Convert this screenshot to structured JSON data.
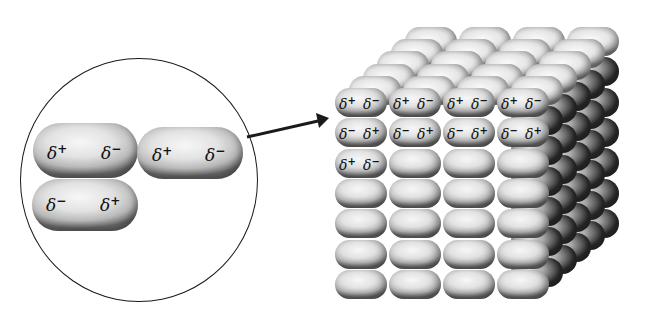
{
  "zoom_inset": {
    "molecules": [
      {
        "left": "δ",
        "left_sign": "+",
        "right": "δ",
        "right_sign": "−"
      },
      {
        "left": "δ",
        "left_sign": "+",
        "right": "δ",
        "right_sign": "−"
      },
      {
        "left": "δ",
        "left_sign": "−",
        "right": "δ",
        "right_sign": "+"
      }
    ]
  },
  "arrow": {
    "from": [
      247,
      137
    ],
    "to": [
      328,
      119
    ]
  },
  "crystal_lattice": {
    "columns": 4,
    "rows": 7,
    "depth_layers": 6,
    "labeled_rows": [
      [
        {
          "l": "δ",
          "ls": "+",
          "r": "δ",
          "rs": "−"
        },
        {
          "l": "δ",
          "ls": "+",
          "r": "δ",
          "rs": "−"
        },
        {
          "l": "δ",
          "ls": "+",
          "r": "δ",
          "rs": "−"
        },
        {
          "l": "δ",
          "ls": "+",
          "r": "δ",
          "rs": "−"
        }
      ],
      [
        {
          "l": "δ",
          "ls": "−",
          "r": "δ",
          "rs": "+"
        },
        {
          "l": "δ",
          "ls": "−",
          "r": "δ",
          "rs": "+"
        },
        {
          "l": "δ",
          "ls": "−",
          "r": "δ",
          "rs": "+"
        },
        {
          "l": "δ",
          "ls": "−",
          "r": "δ",
          "rs": "+"
        }
      ],
      [
        {
          "l": "δ",
          "ls": "+",
          "r": "δ",
          "rs": "−"
        }
      ]
    ]
  }
}
